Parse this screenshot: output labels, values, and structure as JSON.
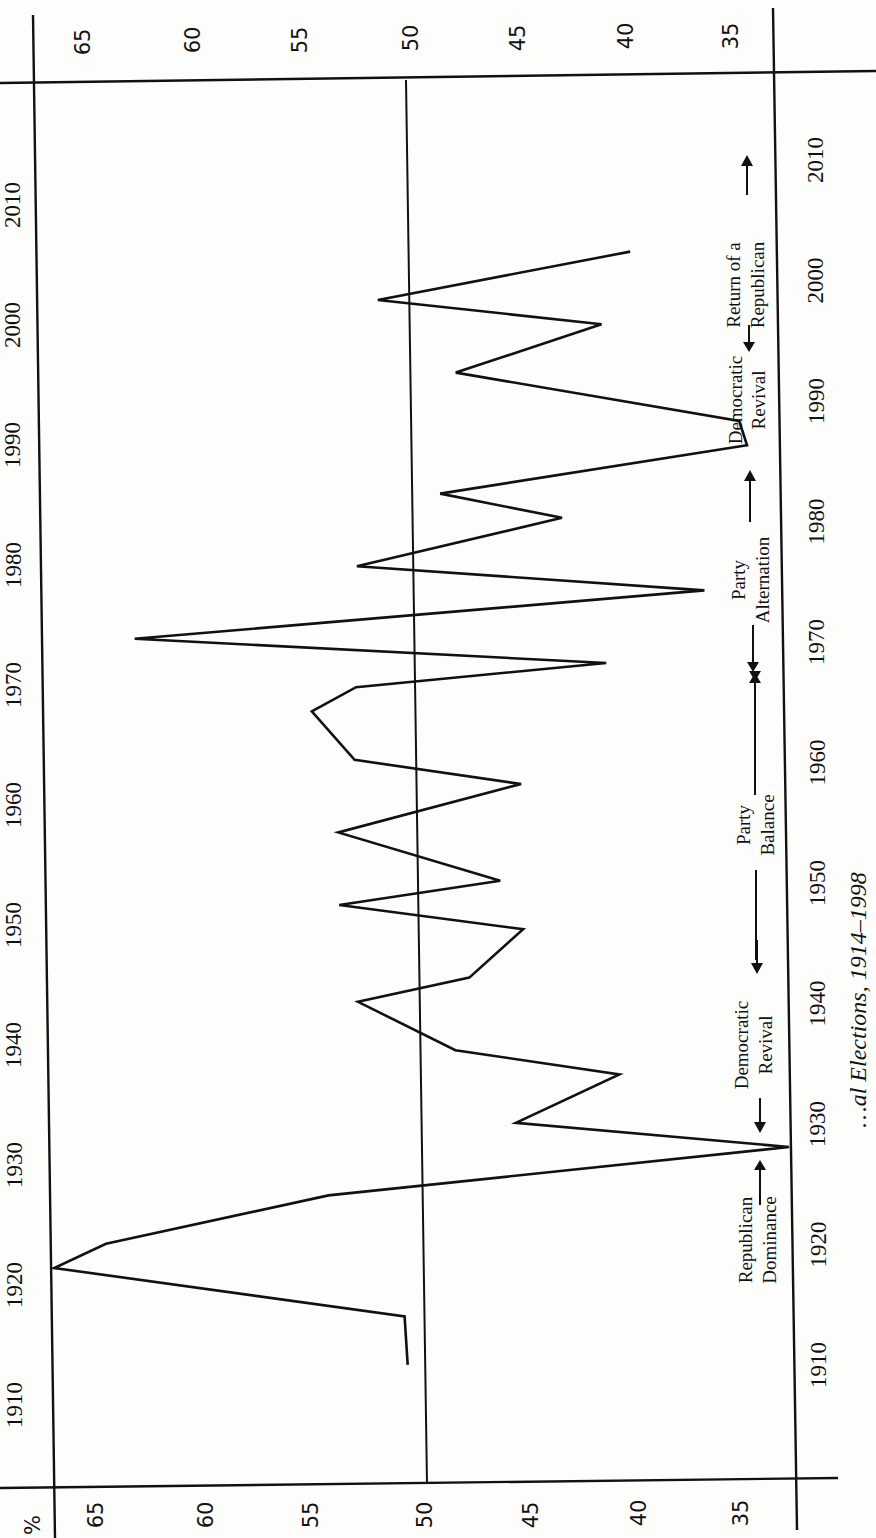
{
  "chart_data": {
    "type": "line",
    "orientation": "rotated-90-ccw",
    "title": "",
    "caption": "…al Elections, 1914–1998",
    "xlabel": "Year",
    "ylabel": "%",
    "xlim": [
      1910,
      2010
    ],
    "ylim": [
      35,
      65
    ],
    "reference_line": 50,
    "x_ticks": [
      1910,
      1920,
      1930,
      1940,
      1950,
      1960,
      1970,
      1980,
      1990,
      2000,
      2010
    ],
    "y_ticks": [
      65,
      60,
      55,
      50,
      45,
      40,
      35
    ],
    "grid": false,
    "series": [
      {
        "name": "Republican vote share",
        "x": [
          1912,
          1916,
          1920,
          1922,
          1926,
          1930,
          1932,
          1936,
          1938,
          1942,
          1944,
          1948,
          1950,
          1952,
          1956,
          1960,
          1962,
          1966,
          1968,
          1970,
          1972,
          1976,
          1978,
          1982,
          1984,
          1988,
          1990,
          1994,
          1998,
          2000,
          2004
        ],
        "values": [
          50.9,
          51.0,
          65.1,
          63.0,
          54.0,
          35.4,
          46.4,
          42.2,
          48.8,
          52.7,
          48.2,
          46.0,
          53.4,
          46.9,
          53.4,
          46.0,
          52.7,
          54.4,
          52.6,
          42.5,
          61.5,
          38.5,
          52.5,
          44.2,
          49.1,
          36.7,
          37.0,
          48.4,
          42.5,
          51.5,
          41.3
        ]
      }
    ],
    "annotations": [
      {
        "line1": "Republican",
        "line2": "Dominance",
        "from": 1914,
        "to": 1930,
        "arrows": "up"
      },
      {
        "line1": "Democratic",
        "line2": "Revival",
        "from": 1930,
        "to": 1946,
        "arrows": "both"
      },
      {
        "line1": "Party",
        "line2": "Balance",
        "from": 1946,
        "to": 1968,
        "arrows": "both"
      },
      {
        "line1": "Party",
        "line2": "Alternation",
        "from": 1968,
        "to": 1986,
        "arrows": "both"
      },
      {
        "line1": "Democratic",
        "line2": "Revival",
        "from": 1986,
        "to": 1996,
        "arrows": "none"
      },
      {
        "line1": "Return of a",
        "line2": "Republican",
        "from": 1996,
        "to": 2010,
        "arrows": "both"
      }
    ]
  },
  "axis": {
    "pct_symbol": "%",
    "pct_labels_left": [
      "65",
      "60",
      "55",
      "50",
      "45",
      "40",
      "35"
    ],
    "pct_labels_top": [
      "65",
      "60",
      "55",
      "50",
      "45",
      "40",
      "35"
    ],
    "year_labels": [
      "1910",
      "1920",
      "1930",
      "1940",
      "1950",
      "1960",
      "1970",
      "1980",
      "1990",
      "2000",
      "2010"
    ]
  },
  "annotations_text": {
    "rep_dom_1": "Republican",
    "rep_dom_2": "Dominance",
    "dem_rev_1": "Democratic",
    "dem_rev_2": "Revival",
    "balance_1": "Party",
    "balance_2": "Balance",
    "altern_1": "Party",
    "altern_2": "Alternation",
    "dem_rev2_1": "Democratic",
    "dem_rev2_2": "Revival",
    "return_1": "Return of a",
    "return_2": "Republican"
  },
  "caption_text": "…al Elections, 1914–1998"
}
